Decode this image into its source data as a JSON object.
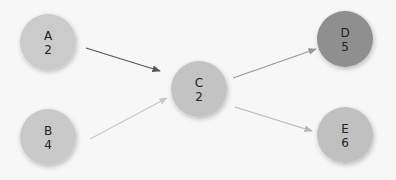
{
  "diagram": {
    "type": "directed-graph",
    "background": "#f7f7f7",
    "nodes": [
      {
        "id": "A",
        "label": "A",
        "value": "2",
        "cx": 48,
        "cy": 42,
        "r": 28,
        "color": "#cbcbcb"
      },
      {
        "id": "B",
        "label": "B",
        "value": "4",
        "cx": 48,
        "cy": 137,
        "r": 28,
        "color": "#c9c9c9"
      },
      {
        "id": "C",
        "label": "C",
        "value": "2",
        "cx": 199,
        "cy": 89,
        "r": 28,
        "color": "#c3c3c3"
      },
      {
        "id": "D",
        "label": "D",
        "value": "5",
        "cx": 345,
        "cy": 39,
        "r": 28,
        "color": "#8f8f8f"
      },
      {
        "id": "E",
        "label": "E",
        "value": "6",
        "cx": 345,
        "cy": 135,
        "r": 28,
        "color": "#c0c0c0"
      }
    ],
    "edges": [
      {
        "from": "A",
        "to": "C",
        "x1": 86,
        "y1": 48,
        "x2": 160,
        "y2": 71,
        "color": "#555555"
      },
      {
        "from": "B",
        "to": "C",
        "x1": 90,
        "y1": 139,
        "x2": 167,
        "y2": 98,
        "color": "#c8c8c8"
      },
      {
        "from": "C",
        "to": "D",
        "x1": 233,
        "y1": 78,
        "x2": 316,
        "y2": 49,
        "color": "#999999"
      },
      {
        "from": "C",
        "to": "E",
        "x1": 235,
        "y1": 107,
        "x2": 312,
        "y2": 131,
        "color": "#b8b8b8"
      }
    ]
  }
}
